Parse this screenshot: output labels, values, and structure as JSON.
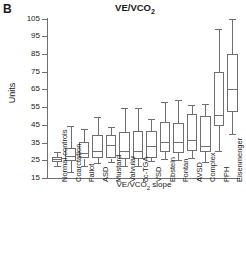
{
  "panel": {
    "label": "B"
  },
  "chart_data": {
    "type": "box",
    "title": "VE/VCO2",
    "title_main": "VE/VCO",
    "title_sub": "2",
    "xlabel": "VE/VCO2 slope",
    "xlabel_main": "VE/VCO",
    "xlabel_sub": "2",
    "xlabel_tail": " slope",
    "ylabel": "Units",
    "ylim": [
      15,
      105
    ],
    "yticks": [
      15,
      25,
      35,
      45,
      55,
      65,
      75,
      85,
      95,
      105
    ],
    "ytick_labels": [
      "15",
      "25",
      "35",
      "45",
      "55",
      "65",
      "75",
      "85",
      "95",
      "105"
    ],
    "grid": false,
    "legend": "none",
    "categories": [
      "Normal controls",
      "Coarctation",
      "Fallot",
      "ASD",
      "Mustard",
      "Valvular",
      "cc-TGA",
      "VSD",
      "Ebstein",
      "Fontan",
      "AVSD",
      "Complex",
      "PPH",
      "Eisenmenger"
    ],
    "boxes": [
      {
        "name": "Normal controls",
        "whisker_low": 21.5,
        "q1": 24.0,
        "median": 25.5,
        "q3": 27.0,
        "whisker_high": 29.5
      },
      {
        "name": "Coarctation",
        "whisker_low": 18.5,
        "q1": 24.5,
        "median": 27.5,
        "q3": 32.0,
        "whisker_high": 44.5
      },
      {
        "name": "Fallot",
        "whisker_low": 21.5,
        "q1": 26.0,
        "median": 29.0,
        "q3": 35.5,
        "whisker_high": 42.5
      },
      {
        "name": "ASD",
        "whisker_low": 23.5,
        "q1": 26.5,
        "median": 30.0,
        "q3": 39.5,
        "whisker_high": 49.5
      },
      {
        "name": "Mustard",
        "whisker_low": 24.0,
        "q1": 26.0,
        "median": 33.5,
        "q3": 39.0,
        "whisker_high": 43.5
      },
      {
        "name": "Valvular",
        "whisker_low": 22.0,
        "q1": 25.5,
        "median": 30.0,
        "q3": 41.0,
        "whisker_high": 54.5
      },
      {
        "name": "cc-TGA",
        "whisker_low": 22.0,
        "q1": 26.0,
        "median": 30.0,
        "q3": 41.5,
        "whisker_high": 54.5
      },
      {
        "name": "VSD",
        "whisker_low": 24.5,
        "q1": 26.5,
        "median": 33.0,
        "q3": 41.5,
        "whisker_high": 48.5
      },
      {
        "name": "Ebstein",
        "whisker_low": 25.5,
        "q1": 29.5,
        "median": 35.5,
        "q3": 46.5,
        "whisker_high": 58.0
      },
      {
        "name": "Fontan",
        "whisker_low": 25.0,
        "q1": 29.0,
        "median": 35.5,
        "q3": 46.0,
        "whisker_high": 59.0
      },
      {
        "name": "AVSD",
        "whisker_low": 26.5,
        "q1": 30.5,
        "median": 36.5,
        "q3": 51.0,
        "whisker_high": 56.0
      },
      {
        "name": "Complex",
        "whisker_low": 24.0,
        "q1": 29.5,
        "median": 33.0,
        "q3": 50.0,
        "whisker_high": 57.0
      },
      {
        "name": "PPH",
        "whisker_low": 30.5,
        "q1": 44.5,
        "median": 50.5,
        "q3": 75.0,
        "whisker_high": 99.0
      },
      {
        "name": "Eisenmenger",
        "whisker_low": 40.0,
        "q1": 52.5,
        "median": 65.0,
        "q3": 85.0,
        "whisker_high": 105.0
      }
    ],
    "colors": {
      "line": "#6f6f6f",
      "fill": "#ffffff",
      "text": "#1a1a1a"
    }
  }
}
